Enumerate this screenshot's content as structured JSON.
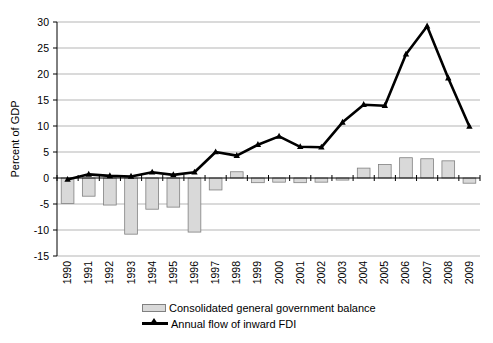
{
  "chart_data": {
    "type": "combo",
    "title": "",
    "ylabel": "Percent of GDP",
    "xlabel": "",
    "categories": [
      "1990",
      "1991",
      "1992",
      "1993",
      "1994",
      "1995",
      "1996",
      "1997",
      "1998",
      "1999",
      "2000",
      "2001",
      "2002",
      "2003",
      "2004",
      "2005",
      "2006",
      "2007",
      "2008",
      "2009"
    ],
    "series": [
      {
        "name": "Consolidated general government balance",
        "type": "bar",
        "values": [
          -4.9,
          -3.5,
          -5.2,
          -10.8,
          -6.0,
          -5.6,
          -10.4,
          -2.3,
          1.2,
          -0.9,
          -0.8,
          -0.9,
          -0.8,
          -0.4,
          1.9,
          2.6,
          3.9,
          3.7,
          3.3,
          -1.0
        ],
        "fill": "#d9d9d9",
        "border": "#808080"
      },
      {
        "name": "Annual flow of inward FDI",
        "type": "line",
        "values": [
          -0.3,
          0.7,
          0.4,
          0.3,
          1.1,
          0.6,
          1.1,
          5.0,
          4.3,
          6.4,
          8.0,
          6.0,
          5.9,
          10.7,
          14.1,
          13.9,
          23.8,
          29.2,
          19.2,
          9.9
        ],
        "color": "#000000",
        "marker": "triangle"
      }
    ],
    "ylim": [
      -15,
      30
    ],
    "ytick_step": 5,
    "yticks": [
      "30",
      "25",
      "20",
      "15",
      "10",
      "5",
      "0",
      "-5",
      "-10",
      "-15"
    ],
    "grid": true,
    "legend_position": "bottom",
    "colors": {
      "gridline": "#b5b5b5",
      "axis": "#000000",
      "background": "#ffffff"
    }
  }
}
